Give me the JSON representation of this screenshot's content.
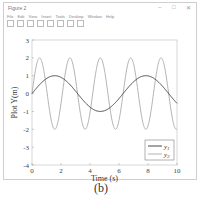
{
  "window": {
    "title": "Figure 2",
    "controls": [
      "minimize",
      "maximize",
      "close"
    ],
    "menu": [
      "File",
      "Edit",
      "View",
      "Insert",
      "Tools",
      "Desktop",
      "Window",
      "Help"
    ]
  },
  "caption": "(b)",
  "chart_data": {
    "type": "line",
    "title": "",
    "xlabel": "Time (s)",
    "ylabel": "Plot Y(m)",
    "xlim": [
      0,
      10
    ],
    "ylim": [
      -4,
      3
    ],
    "xticks": [
      0,
      2,
      4,
      6,
      8,
      10
    ],
    "yticks": [
      -4,
      -3,
      -2,
      -1,
      0,
      1,
      2,
      3
    ],
    "grid": false,
    "legend_position": "lower right",
    "series": [
      {
        "name": "y1",
        "formula": "sin(t)",
        "color": "#333333",
        "amplitude": 1,
        "period": 6.28
      },
      {
        "name": "y2",
        "formula": "2*sin(3t)",
        "color": "#aaaaaa",
        "amplitude": 2,
        "period": 2.09
      }
    ]
  }
}
